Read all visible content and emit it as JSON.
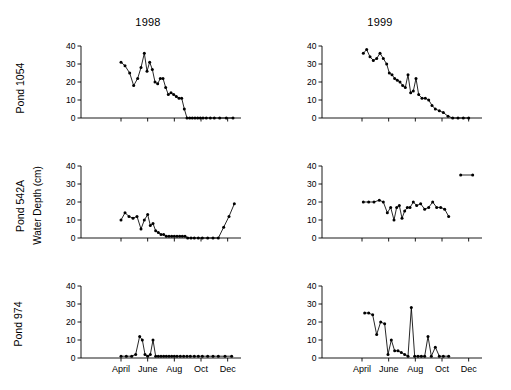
{
  "figure": {
    "column_titles": [
      "1998",
      "1999"
    ],
    "row_labels": [
      "Pond 1054",
      "Pond 542A",
      "Pond 974"
    ],
    "y_axis_label": "Water  Depth  (cm)"
  },
  "chart_data": [
    {
      "type": "line",
      "title": "Pond 1054 1998",
      "panel": {
        "row": 0,
        "col": 0
      },
      "xlabel": "",
      "ylabel": "Water Depth (cm)",
      "ylim": [
        0,
        40
      ],
      "yticks": [
        0,
        10,
        20,
        30,
        40
      ],
      "xlim": [
        0,
        12
      ],
      "xticks": [
        3,
        5,
        7,
        9,
        11
      ],
      "xticklabels": [
        "April",
        "June",
        "Aug",
        "Oct",
        "Dec"
      ],
      "grid": false,
      "marker": "filled-circle",
      "x": [
        3.0,
        3.3,
        3.65,
        3.95,
        4.25,
        4.5,
        4.75,
        4.95,
        5.15,
        5.35,
        5.55,
        5.75,
        5.95,
        6.15,
        6.35,
        6.55,
        6.75,
        6.95,
        7.15,
        7.35,
        7.55,
        7.75,
        7.95,
        8.15,
        8.35,
        8.55,
        8.75,
        8.95,
        9.15,
        9.4,
        9.7,
        10.0,
        10.4,
        10.9,
        11.4
      ],
      "y": [
        31,
        29,
        25,
        18,
        22,
        28,
        36,
        26,
        31,
        27,
        20,
        19,
        22,
        22,
        17,
        13,
        14,
        13,
        12,
        11,
        11,
        5,
        0,
        0,
        0,
        0,
        0,
        0,
        0,
        0,
        0,
        0,
        0,
        0,
        0
      ]
    },
    {
      "type": "line",
      "title": "Pond 1054 1999",
      "panel": {
        "row": 0,
        "col": 1
      },
      "xlabel": "",
      "ylabel": "Water Depth (cm)",
      "ylim": [
        0,
        40
      ],
      "yticks": [
        0,
        10,
        20,
        30,
        40
      ],
      "xlim": [
        0,
        12
      ],
      "xticks": [
        3,
        5,
        7,
        9,
        11
      ],
      "xticklabels": [
        "April",
        "June",
        "Aug",
        "Oct",
        "Dec"
      ],
      "grid": false,
      "marker": "filled-circle",
      "x": [
        3.1,
        3.35,
        3.6,
        3.85,
        4.1,
        4.35,
        4.6,
        4.85,
        5.05,
        5.25,
        5.45,
        5.65,
        5.85,
        6.05,
        6.25,
        6.45,
        6.65,
        6.85,
        7.05,
        7.25,
        7.5,
        7.75,
        8.0,
        8.25,
        8.5,
        8.8,
        9.1,
        9.45,
        9.8,
        10.2,
        10.6,
        11.0
      ],
      "y": [
        36,
        38,
        34,
        32,
        33,
        36,
        33,
        30,
        25,
        24,
        22,
        21,
        20,
        18,
        17,
        24,
        14,
        15,
        22,
        13,
        11,
        11,
        10,
        7,
        5,
        4,
        3,
        1,
        0,
        0,
        0,
        0
      ]
    },
    {
      "type": "line",
      "title": "Pond 542A 1998",
      "panel": {
        "row": 1,
        "col": 0
      },
      "xlabel": "",
      "ylabel": "Water Depth (cm)",
      "ylim": [
        0,
        40
      ],
      "yticks": [
        0,
        10,
        20,
        30,
        40
      ],
      "xlim": [
        0,
        12
      ],
      "xticks": [
        3,
        5,
        7,
        9,
        11
      ],
      "xticklabels": [
        "April",
        "June",
        "Aug",
        "Oct",
        "Dec"
      ],
      "grid": false,
      "marker": "filled-circle",
      "x": [
        3.0,
        3.3,
        3.6,
        3.9,
        4.2,
        4.5,
        4.75,
        5.0,
        5.2,
        5.4,
        5.6,
        5.8,
        6.0,
        6.2,
        6.4,
        6.6,
        6.8,
        7.0,
        7.2,
        7.4,
        7.6,
        7.8,
        8.0,
        8.25,
        8.5,
        8.8,
        9.1,
        9.5,
        9.9,
        10.3,
        10.7,
        11.1,
        11.5
      ],
      "y": [
        10,
        14,
        12,
        11,
        12,
        5,
        10,
        13,
        7,
        8,
        4,
        3,
        2,
        2,
        1,
        1,
        1,
        1,
        1,
        1,
        1,
        1,
        0,
        0,
        0,
        0,
        0,
        0,
        0,
        0,
        6,
        12,
        19
      ]
    },
    {
      "type": "line",
      "title": "Pond 542A 1999",
      "panel": {
        "row": 1,
        "col": 1
      },
      "xlabel": "",
      "ylabel": "Water Depth (cm)",
      "ylim": [
        0,
        40
      ],
      "yticks": [
        0,
        10,
        20,
        30,
        40
      ],
      "xlim": [
        0,
        12
      ],
      "xticks": [
        3,
        5,
        7,
        9,
        11
      ],
      "xticklabels": [
        "April",
        "June",
        "Aug",
        "Oct",
        "Dec"
      ],
      "grid": false,
      "marker": "filled-circle",
      "annotation_segment": {
        "x": [
          10.4,
          11.3
        ],
        "y": [
          35,
          35
        ]
      },
      "x": [
        3.1,
        3.5,
        3.9,
        4.3,
        4.6,
        4.9,
        5.15,
        5.4,
        5.6,
        5.8,
        6.0,
        6.2,
        6.4,
        6.6,
        6.85,
        7.1,
        7.4,
        7.7,
        8.0,
        8.3,
        8.6,
        8.9,
        9.2,
        9.5
      ],
      "y": [
        20,
        20,
        20,
        21,
        20,
        14,
        17,
        10,
        17,
        18,
        11,
        15,
        17,
        17,
        20,
        18,
        19,
        16,
        17,
        20,
        17,
        17,
        16,
        12
      ]
    },
    {
      "type": "line",
      "title": "Pond 974 1998",
      "panel": {
        "row": 2,
        "col": 0
      },
      "xlabel": "",
      "ylabel": "Water Depth (cm)",
      "ylim": [
        0,
        40
      ],
      "yticks": [
        0,
        10,
        20,
        30,
        40
      ],
      "xlim": [
        0,
        12
      ],
      "xticks": [
        3,
        5,
        7,
        9,
        11
      ],
      "xticklabels": [
        "April",
        "June",
        "Aug",
        "Oct",
        "Dec"
      ],
      "grid": false,
      "marker": "filled-circle",
      "x": [
        3.0,
        3.4,
        3.8,
        4.1,
        4.4,
        4.6,
        4.8,
        5.0,
        5.2,
        5.4,
        5.6,
        5.8,
        6.0,
        6.2,
        6.4,
        6.6,
        6.8,
        7.0,
        7.2,
        7.45,
        7.7,
        7.95,
        8.2,
        8.5,
        8.8,
        9.1,
        9.5,
        9.9,
        10.3,
        10.8,
        11.3
      ],
      "y": [
        1,
        1,
        1,
        2,
        12,
        10,
        2,
        1,
        2,
        10,
        1,
        1,
        1,
        1,
        1,
        1,
        1,
        1,
        1,
        1,
        1,
        1,
        1,
        1,
        1,
        1,
        1,
        1,
        1,
        1,
        1
      ]
    },
    {
      "type": "line",
      "title": "Pond 974 1999",
      "panel": {
        "row": 2,
        "col": 1
      },
      "xlabel": "",
      "ylabel": "Water Depth (cm)",
      "ylim": [
        0,
        40
      ],
      "yticks": [
        0,
        10,
        20,
        30,
        40
      ],
      "xlim": [
        0,
        12
      ],
      "xticks": [
        3,
        5,
        7,
        9,
        11
      ],
      "xticklabels": [
        "April",
        "June",
        "Aug",
        "Oct",
        "Dec"
      ],
      "grid": false,
      "marker": "filled-circle",
      "x": [
        3.2,
        3.5,
        3.8,
        4.1,
        4.4,
        4.7,
        4.95,
        5.2,
        5.45,
        5.7,
        5.95,
        6.2,
        6.45,
        6.7,
        6.95,
        7.2,
        7.45,
        7.7,
        7.95,
        8.2,
        8.5,
        8.8,
        9.1,
        9.5
      ],
      "y": [
        25,
        25,
        24,
        13,
        20,
        19,
        2,
        10,
        4,
        4,
        3,
        2,
        1,
        28,
        1,
        1,
        1,
        1,
        12,
        1,
        6,
        1,
        1,
        1
      ]
    }
  ]
}
